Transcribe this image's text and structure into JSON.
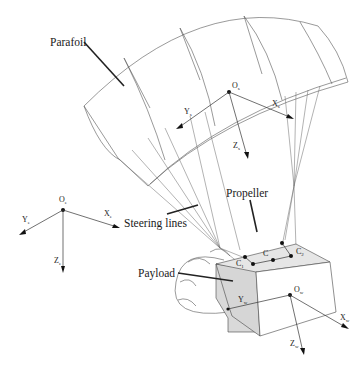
{
  "figure": {
    "labels": {
      "parafoil": "Parafoil",
      "propeller": "Propeller",
      "steering_lines": "Steering lines",
      "payload": "Payload"
    },
    "frames": {
      "parafoil": {
        "origin": "O",
        "x": "X",
        "y": "Y",
        "z": "Z",
        "subscript": "s"
      },
      "earth": {
        "origin": "O",
        "x": "X",
        "y": "Y",
        "z": "Z",
        "subscript": "e"
      },
      "payload": {
        "origin": "O",
        "x": "X",
        "y": "Y",
        "z": "Z",
        "subscript": "w"
      }
    },
    "points": {
      "c1": {
        "label": "C",
        "subscript": "1"
      },
      "c": {
        "label": "C"
      },
      "c2": {
        "label": "C",
        "subscript": "2"
      }
    },
    "colors": {
      "stroke": "#333333",
      "payload_shade": "#d9d9d9",
      "payload_top": "#e6e6e6",
      "background": "#ffffff"
    }
  }
}
